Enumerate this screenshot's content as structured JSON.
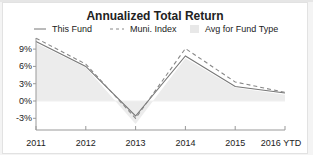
{
  "chart_data": {
    "type": "line",
    "title": "Annualized Total Return",
    "xlabel": "",
    "ylabel": "",
    "categories": [
      "2011",
      "2012",
      "2013",
      "2014",
      "2015",
      "2016 YTD"
    ],
    "yticks": [
      "9%",
      "6%",
      "3%",
      "0%",
      "-3%"
    ],
    "ylim": [
      -5,
      11
    ],
    "grid": false,
    "legend_position": "top",
    "series": [
      {
        "name": "This Fund",
        "style": "solid",
        "color": "#777777",
        "values": [
          10.3,
          6.0,
          -2.6,
          7.8,
          2.5,
          1.4
        ]
      },
      {
        "name": "Muni. Index",
        "style": "dashed",
        "color": "#888888",
        "values": [
          10.9,
          6.4,
          -3.0,
          9.1,
          3.3,
          1.5
        ]
      },
      {
        "name": "Avg for Fund Type",
        "style": "area",
        "color": "#ececec",
        "values": [
          10.0,
          5.8,
          -4.0,
          7.4,
          2.3,
          1.1
        ]
      }
    ]
  },
  "legend": {
    "this_fund": "This Fund",
    "muni_index": "Muni. Index",
    "avg": "Avg for Fund Type"
  }
}
